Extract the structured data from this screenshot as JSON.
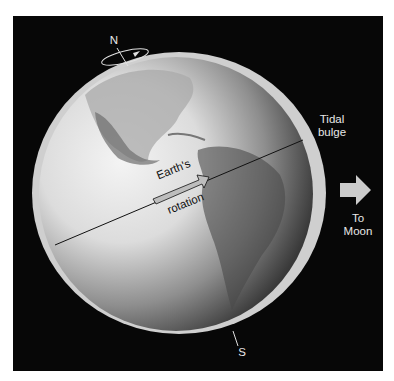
{
  "diagram": {
    "labels": {
      "north": "N",
      "south": "S",
      "tidal_bulge_line1": "Tidal",
      "tidal_bulge_line2": "bulge",
      "to_moon_line1": "To",
      "to_moon_line2": "Moon",
      "rotation_line1": "Earth's",
      "rotation_line2": "rotation"
    },
    "colors": {
      "background": "#070707",
      "page": "#ffffff",
      "bulge": "#cfcfcf",
      "arrow": "#cccccc",
      "text": "#e8e8e8",
      "globe_light": "#f2f2f2",
      "globe_dark": "#1e1e1e"
    }
  }
}
